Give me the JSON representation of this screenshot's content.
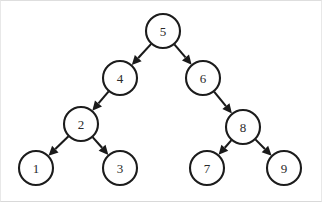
{
  "figure": {
    "kind": "directed-tree-diagram",
    "background_color": "#ffffff",
    "border_color": "#e8e8e8",
    "node_fill": "#ffffff",
    "node_stroke": "#1c1c1c",
    "edge_color": "#1a1a1a",
    "label_color": "#2a2a2a",
    "node_radius": 17,
    "width": 322,
    "height": 202
  },
  "chart_data": {
    "type": "diagram",
    "nodes": [
      {
        "id": "n5",
        "label": "5",
        "x": 163,
        "y": 31,
        "level": 0
      },
      {
        "id": "n4",
        "label": "4",
        "x": 120,
        "y": 78,
        "level": 1
      },
      {
        "id": "n6",
        "label": "6",
        "x": 203,
        "y": 78,
        "level": 1
      },
      {
        "id": "n2",
        "label": "2",
        "x": 81,
        "y": 124,
        "level": 2
      },
      {
        "id": "n8",
        "label": "8",
        "x": 243,
        "y": 127,
        "level": 2
      },
      {
        "id": "n1",
        "label": "1",
        "x": 36,
        "y": 168,
        "level": 3
      },
      {
        "id": "n3",
        "label": "3",
        "x": 120,
        "y": 168,
        "level": 3
      },
      {
        "id": "n7",
        "label": "7",
        "x": 207,
        "y": 168,
        "level": 3
      },
      {
        "id": "n9",
        "label": "9",
        "x": 284,
        "y": 168,
        "level": 3
      }
    ],
    "edges": [
      {
        "from": "n5",
        "to": "n4",
        "directed": true,
        "side": "left"
      },
      {
        "from": "n5",
        "to": "n6",
        "directed": true,
        "side": "right"
      },
      {
        "from": "n4",
        "to": "n2",
        "directed": true,
        "side": "left"
      },
      {
        "from": "n6",
        "to": "n8",
        "directed": true,
        "side": "right"
      },
      {
        "from": "n2",
        "to": "n1",
        "directed": true,
        "side": "left"
      },
      {
        "from": "n2",
        "to": "n3",
        "directed": true,
        "side": "right"
      },
      {
        "from": "n8",
        "to": "n7",
        "directed": true,
        "side": "left"
      },
      {
        "from": "n8",
        "to": "n9",
        "directed": true,
        "side": "right"
      }
    ]
  }
}
